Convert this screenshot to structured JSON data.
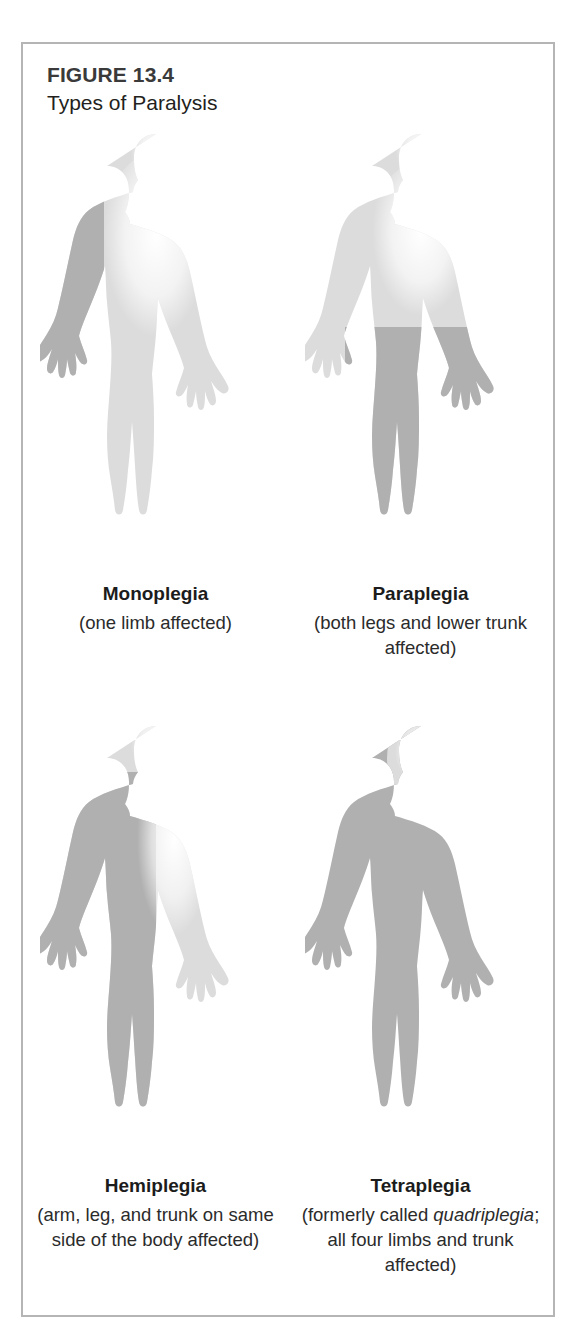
{
  "figure": {
    "number": "FIGURE 13.4",
    "title": "Types of Paralysis",
    "border_color": "#b5b5b5",
    "background_color": "#ffffff"
  },
  "palette": {
    "affected_shade": "#b0b0b0",
    "unaffected_shade": "#dcdcdc",
    "highlight": "#ffffff",
    "text_color": "#231f20"
  },
  "panels": [
    {
      "term": "Monoplegia",
      "description": "(one limb affected)",
      "affected_region": "one arm",
      "shading_pattern": "single-limb"
    },
    {
      "term": "Paraplegia",
      "description": "(both legs and lower trunk affected)",
      "affected_region": "both legs and lower trunk",
      "shading_pattern": "lower-body"
    },
    {
      "term": "Hemiplegia",
      "description": "(arm, leg, and trunk on same side of the body affected)",
      "affected_region": "arm, leg and trunk on one side",
      "shading_pattern": "vertical-half"
    },
    {
      "term": "Tetraplegia",
      "description_parts": {
        "before": "(formerly called ",
        "italic": "quadriplegia",
        "after": "; all four limbs and trunk affected)"
      },
      "description": "(formerly called quadriplegia; all four limbs and trunk affected)",
      "affected_region": "all four limbs and trunk",
      "shading_pattern": "whole-body"
    }
  ]
}
